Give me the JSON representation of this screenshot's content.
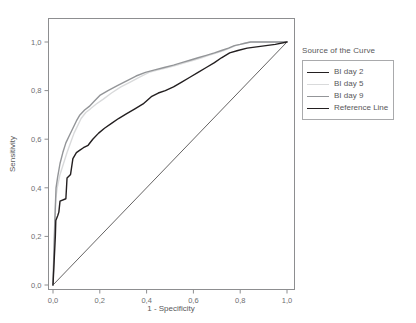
{
  "figure": {
    "background_color": "#ffffff",
    "frame_color": "#8d8e90"
  },
  "legend": {
    "title": "Source of the Curve",
    "position": "right",
    "entries": [
      {
        "label": "BI day 2",
        "color": "#231f20"
      },
      {
        "label": "BI day 5",
        "color": "#d9dadb"
      },
      {
        "label": "BI day 9",
        "color": "#939598"
      },
      {
        "label": "Reference Line",
        "color": "#231f20"
      }
    ]
  },
  "chart_data": {
    "type": "line",
    "title": "",
    "xlabel": "1 - Specificity",
    "ylabel": "Sensitivity",
    "xlim": [
      0,
      1
    ],
    "ylim": [
      0,
      1
    ],
    "grid": false,
    "legend_position": "right",
    "legend_title": "Source of the Curve",
    "xticks": [
      0,
      0.2,
      0.4,
      0.6,
      0.8,
      1.0
    ],
    "yticks": [
      0,
      0.2,
      0.4,
      0.6,
      0.8,
      1.0
    ],
    "xticklabels": [
      "0,0",
      "0,2",
      "0,4",
      "0,6",
      "0,8",
      "1,0"
    ],
    "yticklabels": [
      "0,0",
      "0,2",
      "0,4",
      "0,6",
      "0,8",
      "1,0"
    ],
    "decimal_separator": ",",
    "series": [
      {
        "name": "BI day 2",
        "color": "#231f20",
        "linewidth": 1.4,
        "x": [
          0.0,
          0.005,
          0.01,
          0.012,
          0.02,
          0.025,
          0.03,
          0.055,
          0.06,
          0.075,
          0.085,
          0.1,
          0.115,
          0.13,
          0.15,
          0.17,
          0.195,
          0.22,
          0.25,
          0.28,
          0.315,
          0.35,
          0.385,
          0.42,
          0.45,
          0.48,
          0.515,
          0.55,
          0.585,
          0.62,
          0.655,
          0.69,
          0.72,
          0.755,
          0.79,
          0.83,
          0.87,
          0.91,
          0.95,
          1.0
        ],
        "y": [
          0.0,
          0.1,
          0.2,
          0.265,
          0.285,
          0.3,
          0.345,
          0.355,
          0.44,
          0.455,
          0.52,
          0.545,
          0.555,
          0.565,
          0.575,
          0.6,
          0.625,
          0.645,
          0.665,
          0.685,
          0.705,
          0.725,
          0.745,
          0.775,
          0.79,
          0.8,
          0.815,
          0.835,
          0.855,
          0.875,
          0.895,
          0.915,
          0.935,
          0.955,
          0.965,
          0.975,
          0.98,
          0.985,
          0.99,
          1.0
        ]
      },
      {
        "name": "BI day 5",
        "color": "#d9dadb",
        "linewidth": 1.4,
        "x": [
          0.0,
          0.004,
          0.008,
          0.012,
          0.018,
          0.03,
          0.045,
          0.06,
          0.075,
          0.09,
          0.105,
          0.12,
          0.14,
          0.16,
          0.185,
          0.215,
          0.25,
          0.29,
          0.33,
          0.37,
          0.41,
          0.45,
          0.49,
          0.53,
          0.565,
          0.6,
          0.635,
          0.665,
          0.7,
          0.73,
          0.755,
          0.78,
          0.8,
          0.82,
          0.84,
          0.87,
          0.9,
          0.93,
          0.96,
          1.0
        ],
        "y": [
          0.0,
          0.12,
          0.24,
          0.355,
          0.4,
          0.455,
          0.5,
          0.545,
          0.585,
          0.625,
          0.655,
          0.685,
          0.71,
          0.725,
          0.745,
          0.765,
          0.79,
          0.815,
          0.835,
          0.855,
          0.875,
          0.885,
          0.895,
          0.905,
          0.915,
          0.925,
          0.935,
          0.945,
          0.955,
          0.965,
          0.975,
          0.985,
          0.99,
          0.995,
          1.0,
          1.0,
          1.0,
          1.0,
          1.0,
          1.0
        ]
      },
      {
        "name": "BI day 9",
        "color": "#939598",
        "linewidth": 1.4,
        "x": [
          0.0,
          0.004,
          0.008,
          0.013,
          0.02,
          0.03,
          0.042,
          0.055,
          0.07,
          0.085,
          0.1,
          0.115,
          0.135,
          0.155,
          0.175,
          0.2,
          0.235,
          0.275,
          0.315,
          0.355,
          0.395,
          0.435,
          0.475,
          0.515,
          0.55,
          0.585,
          0.62,
          0.655,
          0.69,
          0.72,
          0.75,
          0.775,
          0.8,
          0.82,
          0.845,
          0.875,
          0.905,
          0.935,
          0.965,
          1.0
        ],
        "y": [
          0.0,
          0.14,
          0.27,
          0.4,
          0.445,
          0.5,
          0.545,
          0.585,
          0.615,
          0.645,
          0.675,
          0.7,
          0.72,
          0.735,
          0.755,
          0.78,
          0.8,
          0.82,
          0.84,
          0.86,
          0.875,
          0.885,
          0.895,
          0.905,
          0.915,
          0.925,
          0.935,
          0.945,
          0.955,
          0.965,
          0.975,
          0.985,
          0.99,
          0.995,
          1.0,
          1.0,
          1.0,
          1.0,
          1.0,
          1.0
        ]
      },
      {
        "name": "Reference Line",
        "color": "#231f20",
        "linewidth": 0.7,
        "x": [
          0.0,
          1.0
        ],
        "y": [
          0.0,
          1.0
        ]
      }
    ]
  }
}
